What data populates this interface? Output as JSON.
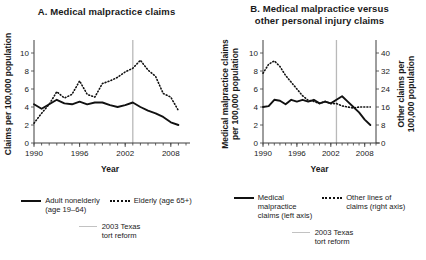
{
  "figure": {
    "panels": [
      {
        "id": "A",
        "title": "A.  Medical malpractice claims",
        "legend": {
          "series1": "Adult nonelderly\n(age 19–64)",
          "series1_line1": "Adult nonelderly",
          "series1_line2": "(age 19–64)",
          "series2": "Elderly (age 65+)",
          "reform_line1": "2003 Texas",
          "reform_line2": "tort reform"
        }
      },
      {
        "id": "B",
        "title_line1": "B.  Medical malpractice versus",
        "title_line2": "other personal injury claims",
        "legend": {
          "series1_line1": "Medical",
          "series1_line2": "malpractice",
          "series1_line3": "claims (left axis)",
          "series2_line1": "Other lines of",
          "series2_line2": "claims (right axis)",
          "reform_line1": "2003 Texas",
          "reform_line2": "tort reform"
        }
      }
    ]
  },
  "chart_data": [
    {
      "type": "line",
      "panel": "A",
      "title": "A.  Medical malpractice claims",
      "xlabel": "Year",
      "ylabel": "Claims per 100,000 population",
      "xlim": [
        1990,
        2010
      ],
      "ylim": [
        0,
        11
      ],
      "yticks": [
        0,
        2,
        4,
        6,
        8,
        10
      ],
      "xticks": [
        1990,
        1996,
        2002,
        2008
      ],
      "xminor_step": 1,
      "grid": false,
      "legend_position": "below",
      "annotations": [
        {
          "type": "vline",
          "x": 2003,
          "label": "2003 Texas tort reform",
          "color": "#b9b9b9"
        }
      ],
      "x": [
        1990,
        1991,
        1992,
        1993,
        1994,
        1995,
        1996,
        1997,
        1998,
        1999,
        2000,
        2001,
        2002,
        2003,
        2004,
        2005,
        2006,
        2007,
        2008,
        2009
      ],
      "series": [
        {
          "name": "Adult nonelderly (age 19–64)",
          "style": "solid",
          "values": [
            4.3,
            3.8,
            4.3,
            4.8,
            4.4,
            4.3,
            4.6,
            4.3,
            4.5,
            4.5,
            4.2,
            4.0,
            4.2,
            4.5,
            4.0,
            3.6,
            3.3,
            2.9,
            2.3,
            2.0
          ]
        },
        {
          "name": "Elderly (age 65+)",
          "style": "dotted",
          "values": [
            2.2,
            3.3,
            4.3,
            5.7,
            5.0,
            5.4,
            6.9,
            5.4,
            5.1,
            6.6,
            6.9,
            7.3,
            7.9,
            8.3,
            9.2,
            8.1,
            7.4,
            5.5,
            5.1,
            3.6
          ]
        }
      ]
    },
    {
      "type": "line",
      "panel": "B",
      "title_line1": "B.  Medical malpractice versus",
      "title_line2": "other personal injury claims",
      "xlabel": "Year",
      "ylabel_left": "Medical malpractice claims per 100,000 population",
      "ylabel_right": "Other claims per 100,000 population",
      "xlim": [
        1990,
        2010
      ],
      "ylim_left": [
        0,
        11
      ],
      "ylim_right": [
        0,
        44
      ],
      "yticks_left": [
        0,
        2,
        4,
        6,
        8,
        10
      ],
      "yticks_right": [
        0,
        8,
        16,
        24,
        32,
        40
      ],
      "xticks": [
        1990,
        1996,
        2002,
        2008
      ],
      "xminor_step": 1,
      "grid": false,
      "legend_position": "below",
      "annotations": [
        {
          "type": "vline",
          "x": 2003,
          "label": "2003 Texas tort reform",
          "color": "#b9b9b9"
        }
      ],
      "x": [
        1990,
        1991,
        1992,
        1993,
        1994,
        1995,
        1996,
        1997,
        1998,
        1999,
        2000,
        2001,
        2002,
        2003,
        2004,
        2005,
        2006,
        2007,
        2008,
        2009
      ],
      "series": [
        {
          "name": "Medical malpractice claims (left axis)",
          "axis": "left",
          "style": "solid",
          "values": [
            4.0,
            4.1,
            4.8,
            4.7,
            4.3,
            4.8,
            4.6,
            4.8,
            4.6,
            4.8,
            4.4,
            4.6,
            4.4,
            4.8,
            5.2,
            4.6,
            4.0,
            3.4,
            2.6,
            2.0
          ]
        },
        {
          "name": "Other lines of claims (right axis)",
          "axis": "right",
          "style": "dotted",
          "values_right_axis": [
            31,
            35,
            36.5,
            34,
            30,
            27,
            24,
            21,
            19,
            18.5,
            17.5,
            18.5,
            17.5,
            17.5,
            16.5,
            16,
            15.5,
            16,
            16,
            16
          ],
          "values_left_scale": [
            7.75,
            8.75,
            9.12,
            8.5,
            7.5,
            6.75,
            6.0,
            5.25,
            4.75,
            4.62,
            4.38,
            4.62,
            4.38,
            4.38,
            4.12,
            4.0,
            3.88,
            4.0,
            4.0,
            4.0
          ]
        }
      ]
    }
  ]
}
